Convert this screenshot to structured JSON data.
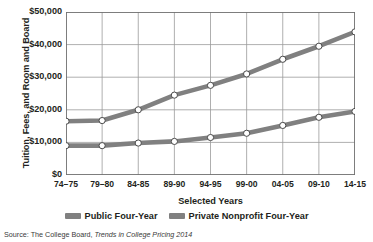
{
  "chart_data": {
    "type": "line",
    "title": "",
    "xlabel": "Selected Years",
    "ylabel": "Tuition, Fees, and Room and Board",
    "categories": [
      "74–75",
      "79–80",
      "84-85",
      "89-90",
      "94-95",
      "99-00",
      "04-05",
      "09-10",
      "14-15"
    ],
    "ylim": [
      0,
      50000
    ],
    "ytick_labels": [
      "$0",
      "$10,000",
      "$20,000",
      "$30,000",
      "$40,000",
      "$50,000"
    ],
    "ytick_values": [
      0,
      10000,
      20000,
      30000,
      40000,
      50000
    ],
    "grid": true,
    "legend_position": "bottom",
    "series": [
      {
        "name": "Public Four-Year",
        "color": "#808080",
        "values": [
          9000,
          9000,
          9800,
          10300,
          11500,
          12800,
          15200,
          17700,
          19500
        ]
      },
      {
        "name": "Private Nonprofit Four-Year",
        "color": "#808080",
        "values": [
          16500,
          16700,
          20000,
          24500,
          27500,
          31000,
          35500,
          39500,
          43900
        ]
      }
    ],
    "source": {
      "prefix": "Source: The College Board, ",
      "italic": "Trends in College Pricing 2014"
    }
  },
  "colors": {
    "line": "#7e7e7e",
    "marker_fill": "#ffffff",
    "marker_stroke": "#4a4a4a",
    "grid": "#9a9a9a",
    "axis": "#6e6e6e",
    "text": "#231f20",
    "source_text": "#3a3a3a",
    "background": "#ffffff"
  }
}
